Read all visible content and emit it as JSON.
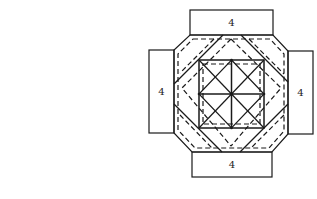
{
  "diagram": {
    "flaps": {
      "top": {
        "label": "4"
      },
      "left": {
        "label": "4"
      },
      "right": {
        "label": "4"
      },
      "bottom": {
        "label": "4"
      }
    },
    "colors": {
      "stroke": "#1a1a1a",
      "background": "#ffffff"
    }
  }
}
